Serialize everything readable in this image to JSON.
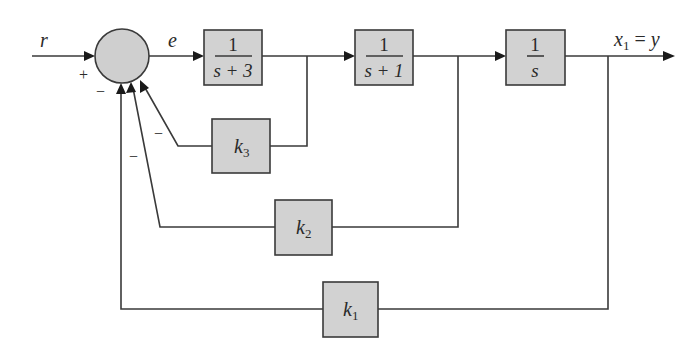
{
  "diagram": {
    "type": "control-system-block-diagram",
    "signals": {
      "input": "r",
      "error": "e",
      "output_main": "x",
      "output_sub": "1",
      "output_eq": " = ",
      "output_alias": "y"
    },
    "summing_junction": {
      "signs": {
        "input": "+",
        "k1": "−",
        "k2": "−",
        "k3": "−"
      }
    },
    "forward_blocks": [
      {
        "id": "g1",
        "numerator": "1",
        "denominator": "s + 3"
      },
      {
        "id": "g2",
        "numerator": "1",
        "denominator": "s + 1"
      },
      {
        "id": "g3",
        "numerator": "1",
        "denominator": "s"
      }
    ],
    "feedback_blocks": [
      {
        "id": "k3",
        "base": "k",
        "sub": "3",
        "from": "output of 1/(s+3)"
      },
      {
        "id": "k2",
        "base": "k",
        "sub": "2",
        "from": "output of 1/(s+1)"
      },
      {
        "id": "k1",
        "base": "k",
        "sub": "1",
        "from": "output x1 = y"
      }
    ],
    "colors": {
      "block_fill": "#d2d2d2",
      "line": "#3a3a3a",
      "background": "#ffffff"
    }
  }
}
